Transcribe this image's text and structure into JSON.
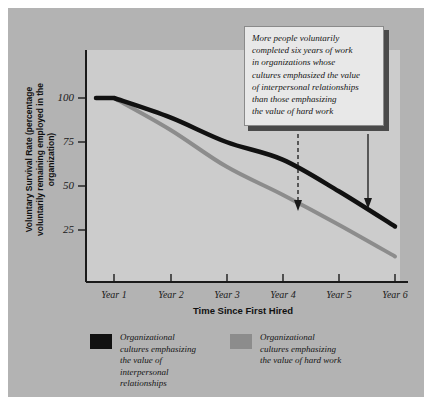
{
  "chart_data": {
    "type": "line",
    "title": "",
    "xlabel": "Time Since First Hired",
    "ylabel": "Voluntary Survival Rate\n(percentage voluntarily remaining\nemployed in the organization)",
    "x": [
      1,
      2,
      3,
      4,
      5,
      6
    ],
    "xtick_labels": [
      "Year 1",
      "Year 2",
      "Year 3",
      "Year 4",
      "Year 5",
      "Year 6"
    ],
    "ytick_labels": [
      "100",
      "75",
      "50",
      "25"
    ],
    "ytick_values": [
      100,
      75,
      50,
      25
    ],
    "ylim": [
      0,
      105
    ],
    "xlim": [
      0.6,
      6.2
    ],
    "grid": false,
    "legend_position": "below",
    "series": [
      {
        "name": "Organizational cultures emphasizing the value of interpersonal relationships",
        "color": "#111111",
        "values": [
          100,
          89,
          75,
          65,
          47,
          27
        ]
      },
      {
        "name": "Organizational cultures emphasizing the value of hard work",
        "color": "#8c8c8c",
        "values": [
          100,
          82,
          61,
          45,
          28,
          10
        ]
      }
    ],
    "annotations": [
      {
        "text": "More people voluntarily\ncompleted six years of work\nin organizations whose\ncultures emphasized the value\nof interpersonal relationships\nthan those emphasizing\nthe value of hard work",
        "arrows": [
          {
            "style": "dashed",
            "target_series": "Organizational cultures emphasizing the value of hard work"
          },
          {
            "style": "solid",
            "target_series": "Organizational cultures emphasizing the value of interpersonal relationships"
          }
        ]
      }
    ]
  },
  "axes": {
    "ylabel": "Voluntary Survival Rate\n(percentage voluntarily remaining\nemployed in the organization)",
    "xlabel": "Time Since First Hired",
    "yticks": [
      {
        "label": "100"
      },
      {
        "label": "75"
      },
      {
        "label": "50"
      },
      {
        "label": "25"
      }
    ],
    "xticks": [
      {
        "label": "Year 1"
      },
      {
        "label": "Year 2"
      },
      {
        "label": "Year 3"
      },
      {
        "label": "Year 4"
      },
      {
        "label": "Year 5"
      },
      {
        "label": "Year 6"
      }
    ]
  },
  "callout": {
    "text": "More people voluntarily\ncompleted six years of work\nin organizations whose\ncultures emphasized the value\nof interpersonal relationships\nthan those emphasizing\nthe value of hard work"
  },
  "legend": {
    "entries": [
      {
        "label": "Organizational\ncultures emphasizing\nthe value of\ninterpersonal\nrelationships",
        "color": "#111111"
      },
      {
        "label": "Organizational\ncultures emphasizing\nthe value of hard work",
        "color": "#8c8c8c"
      }
    ]
  },
  "colors": {
    "panel_background": "#b3b3b3",
    "plot_background": "#cccccc",
    "series_black": "#111111",
    "series_gray": "#8c8c8c",
    "axis": "#1a1a1a"
  }
}
